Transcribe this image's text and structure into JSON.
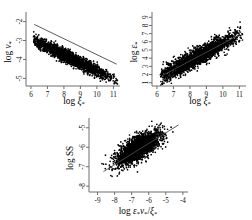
{
  "figure": {
    "kind": "scatter-panel-figure",
    "panel_count": 3,
    "background": "#ffffff",
    "point_color": "#000000",
    "axis_color": "#6f6f6f",
    "fit_line_color": "#4a4a4a"
  },
  "chart_data": [
    {
      "id": "panel-a",
      "type": "scatter",
      "title": "",
      "xlabel": "log ξ*",
      "ylabel": "log ν*",
      "xlabel_parts": {
        "prefix": "log ",
        "symbol": "ξ",
        "sub": "*"
      },
      "ylabel_parts": {
        "prefix": "log ",
        "symbol": "ν",
        "sub": "*"
      },
      "xlim": [
        5.7,
        11.4
      ],
      "ylim": [
        -5.4,
        -1.6
      ],
      "xticks": [
        6,
        7,
        8,
        9,
        10,
        11
      ],
      "xticklabels": [
        "6",
        "7",
        "8",
        "9",
        "10",
        "11"
      ],
      "yticks": [
        -2,
        -3,
        -4,
        -5
      ],
      "yticklabels": [
        "-2",
        "-3",
        "-4",
        "-5"
      ],
      "grid": false,
      "legend": "none",
      "has_fit_line": true,
      "fit_line": {
        "x": [
          6.2,
          11.2
        ],
        "y": [
          -2.15,
          -4.25
        ]
      },
      "relationship": "negative",
      "n_points": 2200,
      "cloud": {
        "x_center": 8.35,
        "y_intercept": -0.4,
        "slope": -0.42,
        "x_spread": 1.25,
        "y_scatter": 0.16,
        "x_min": 6.15,
        "x_max": 11.25
      },
      "series": [
        {
          "name": "halos",
          "x": [
            6.2,
            6.6,
            7.0,
            7.4,
            7.8,
            8.2,
            8.6,
            9.0,
            9.4,
            9.8,
            10.2,
            10.6,
            11.0
          ],
          "y": [
            -2.1,
            -2.26,
            -2.43,
            -2.6,
            -2.77,
            -2.95,
            -3.12,
            -3.29,
            -3.46,
            -3.64,
            -3.81,
            -3.98,
            -4.15
          ]
        }
      ]
    },
    {
      "id": "panel-b",
      "type": "scatter",
      "title": "",
      "xlabel": "log ξ*",
      "ylabel": "log ε*",
      "xlabel_parts": {
        "prefix": "log ",
        "symbol": "ξ",
        "sub": "*"
      },
      "ylabel_parts": {
        "prefix": "log ",
        "symbol": "ε",
        "sub": "*"
      },
      "xlim": [
        5.7,
        11.4
      ],
      "ylim": [
        0.6,
        9.4
      ],
      "xticks": [
        6,
        7,
        8,
        9,
        10,
        11
      ],
      "xticklabels": [
        "6",
        "7",
        "8",
        "9",
        "10",
        "11"
      ],
      "yticks": [
        1,
        2,
        3,
        4,
        5,
        6,
        7,
        8,
        9
      ],
      "yticklabels": [
        "1",
        "2",
        "3",
        "4",
        "5",
        "6",
        "7",
        "8",
        "9"
      ],
      "grid": false,
      "legend": "none",
      "has_fit_line": true,
      "fit_line": {
        "x": [
          6.3,
          10.9
        ],
        "y": [
          1.85,
          6.75
        ]
      },
      "relationship": "positive",
      "n_points": 2200,
      "cloud": {
        "x_center": 8.35,
        "y_intercept": -4.9,
        "slope": 1.07,
        "x_spread": 1.25,
        "y_scatter": 0.55,
        "x_min": 6.2,
        "x_max": 11.2
      },
      "series": [
        {
          "name": "halos",
          "x": [
            6.3,
            6.8,
            7.3,
            7.8,
            8.3,
            8.8,
            9.3,
            9.8,
            10.3,
            10.8
          ],
          "y": [
            1.84,
            2.38,
            2.91,
            3.45,
            3.98,
            4.52,
            5.05,
            5.59,
            6.12,
            6.66
          ]
        }
      ]
    },
    {
      "id": "panel-c",
      "type": "scatter",
      "title": "",
      "xlabel": "log ε*ν*/ξ*",
      "ylabel": "log SS",
      "xlabel_parts": {
        "prefix": "log ",
        "num1": "ε",
        "sub1": "*",
        "num2": "ν",
        "sub2": "*",
        "slash": "/",
        "den": "ξ",
        "sub3": "*"
      },
      "ylabel_parts": {
        "prefix": "log ",
        "symbol": "SS",
        "sub": ""
      },
      "xlim": [
        -9.5,
        -3.7
      ],
      "ylim": [
        -8.3,
        -4.6
      ],
      "xticks": [
        -9,
        -8,
        -7,
        -6,
        -5,
        -4
      ],
      "xticklabels": [
        "-9",
        "-8",
        "-7",
        "-6",
        "-5",
        "-4"
      ],
      "yticks": [
        -5,
        -6,
        -7,
        -8
      ],
      "yticklabels": [
        "-5",
        "-6",
        "-7",
        "-8"
      ],
      "grid": false,
      "legend": "none",
      "has_fit_line": true,
      "fit_line": {
        "x": [
          -8.65,
          -4.25
        ],
        "y": [
          -7.25,
          -4.85
        ]
      },
      "relationship": "positive",
      "n_points": 2200,
      "cloud": {
        "x_center": -6.6,
        "y_intercept": -3.0,
        "slope": 0.46,
        "x_spread": 0.62,
        "y_scatter": 0.3,
        "x_min": -8.8,
        "x_max": -4.4
      },
      "series": [
        {
          "name": "halos",
          "x": [
            -8.6,
            -8.1,
            -7.6,
            -7.1,
            -6.6,
            -6.1,
            -5.6,
            -5.1,
            -4.6
          ],
          "y": [
            -7.2,
            -6.97,
            -6.74,
            -6.51,
            -6.28,
            -6.05,
            -5.82,
            -5.59,
            -5.36
          ]
        }
      ]
    }
  ]
}
